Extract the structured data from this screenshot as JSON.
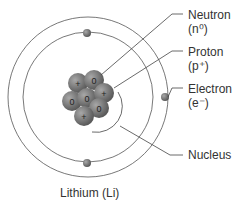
{
  "title": "Lithium (Li)",
  "labels": {
    "neutron": {
      "name": "Neutron",
      "symbol": "(n⁰)"
    },
    "proton": {
      "name": "Proton",
      "symbol": "(p⁺)"
    },
    "electron": {
      "name": "Electron",
      "symbol": "(e⁻)"
    },
    "nucleus": {
      "name": "Nucleus"
    }
  },
  "nucleus_particles": [
    "+",
    "0",
    "0",
    "0",
    "+",
    "0",
    "+"
  ],
  "colors": {
    "line": "#444444",
    "particle": "#7a7a7a",
    "background": "#ffffff"
  }
}
